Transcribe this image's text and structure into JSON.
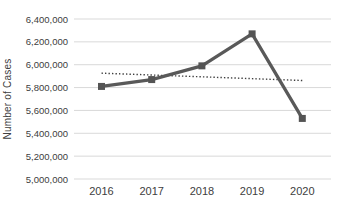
{
  "colors": {
    "background": "#ffffff",
    "line": "#595959",
    "marker": "#545454",
    "trendline": "#3f3f3f",
    "gridline": "#d9d9d9",
    "text": "#404040"
  },
  "chart_data": {
    "type": "line",
    "title": "",
    "xlabel": "",
    "ylabel": "Number of Cases",
    "categories": [
      "2016",
      "2017",
      "2018",
      "2019",
      "2020"
    ],
    "series": [
      {
        "name": "Number of Cases",
        "style": "solid-line-square-markers",
        "values": [
          5810000,
          5870000,
          5990000,
          6270000,
          5530000
        ]
      },
      {
        "name": "Linear trendline",
        "style": "dotted-line",
        "values": [
          5926000,
          5910000,
          5894000,
          5878000,
          5862000
        ]
      }
    ],
    "ylim": [
      5000000,
      6400000
    ],
    "ytick_step": 200000,
    "yticks": [
      {
        "value": 6400000,
        "label": "6,400,000"
      },
      {
        "value": 6200000,
        "label": "6,200,000"
      },
      {
        "value": 6000000,
        "label": "6,000,000"
      },
      {
        "value": 5800000,
        "label": "5,800,000"
      },
      {
        "value": 5600000,
        "label": "5,600,000"
      },
      {
        "value": 5400000,
        "label": "5,400,000"
      },
      {
        "value": 5200000,
        "label": "5,200,000"
      },
      {
        "value": 5000000,
        "label": "5,000,000"
      }
    ],
    "grid": true,
    "legend": false
  }
}
